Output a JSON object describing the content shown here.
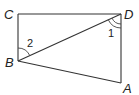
{
  "diagram": {
    "type": "geometry-quadrilateral",
    "points": {
      "C": {
        "label": "C",
        "x": 18,
        "y": 14
      },
      "D": {
        "label": "D",
        "x": 121,
        "y": 14
      },
      "B": {
        "label": "B",
        "x": 18,
        "y": 61
      },
      "A": {
        "label": "A",
        "x": 121,
        "y": 83
      }
    },
    "segments": [
      "CD",
      "CB",
      "DA",
      "BA",
      "BD"
    ],
    "angles": [
      {
        "label": "1",
        "vertex": "D",
        "between": [
          "DB",
          "DA"
        ]
      },
      {
        "label": "2",
        "vertex": "B",
        "between": [
          "BC",
          "BD"
        ]
      }
    ],
    "labels": {
      "C": "C",
      "D": "D",
      "B": "B",
      "A": "A",
      "angle1": "1",
      "angle2": "2"
    },
    "colors": {
      "line": "#333333",
      "text": "#222222",
      "background": "#ffffff"
    }
  }
}
